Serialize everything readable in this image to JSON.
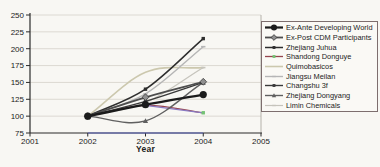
{
  "chart_data": {
    "type": "line",
    "title": "",
    "xlabel": "Year",
    "ylabel": "",
    "xlim": [
      2001,
      2005
    ],
    "ylim": [
      75,
      250
    ],
    "x_ticks": [
      2001,
      2002,
      2003,
      2004,
      2005
    ],
    "y_ticks": [
      75,
      100,
      125,
      150,
      175,
      200,
      225,
      250
    ],
    "grid": "horizontal",
    "legend_position": "right",
    "x": [
      2002,
      2003,
      2004
    ],
    "series": [
      {
        "name": "Ex-Ante Developing World",
        "values": [
          100,
          117,
          132
        ],
        "color": "#1b1b1b",
        "marker": "circle-large",
        "width": 2.4
      },
      {
        "name": "Ex-Post CDM Participants",
        "values": [
          100,
          128,
          151
        ],
        "color": "#4d4d4d",
        "marker": "diamond",
        "marker_fill": "#909090",
        "width": 1.8
      },
      {
        "name": "Zhejiang Juhua",
        "values": [
          100,
          140,
          215
        ],
        "color": "#2e2e2e",
        "marker": "square-small",
        "width": 1.5
      },
      {
        "name": "Shandong Donguye",
        "values": [
          100,
          116,
          105
        ],
        "color": "#96454e",
        "marker": "square-small",
        "marker_fill": "#74c274",
        "width": 1.3,
        "end_segment_color": "#8a7ac2"
      },
      {
        "name": "Quimobasicos",
        "values": [
          100,
          165,
          172
        ],
        "color": "#ccc8ae",
        "marker": "none",
        "width": 1.6
      },
      {
        "name": "Jiangsu Meilan",
        "values": [
          100,
          133,
          203
        ],
        "color": "#b6b6b6",
        "marker": "dash-small",
        "width": 1.4
      },
      {
        "name": "Changshu 3f",
        "values": [
          100,
          122,
          150
        ],
        "color": "#3a3a3a",
        "marker": "square-small",
        "width": 1.4
      },
      {
        "name": "Zhejiang Dongyang",
        "values": [
          100,
          93,
          150
        ],
        "color": "#606060",
        "marker": "triangle-small",
        "width": 1.4
      },
      {
        "name": "Limin Chemicals",
        "values": [
          100,
          120,
          172
        ],
        "color": "#c6c4bc",
        "marker": "dash-small",
        "width": 1.2
      }
    ],
    "baseline_segment": {
      "x_from": 2002,
      "x_to": 2004,
      "value": 75,
      "color": "#5560c8"
    },
    "axis_color": "#2a2a2a",
    "grid_color": "#dcd9d2",
    "plot_right_border_color": "#b5b2aa"
  }
}
